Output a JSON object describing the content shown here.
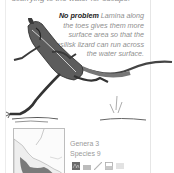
{
  "page": {
    "top_text_fragment": "scurrying to the water for escape.",
    "caption": {
      "heading": "No problem",
      "body": "Lamina along the toes gives them more surface area so that the basilisk lizard can run across the water surface."
    },
    "illustration": {
      "subject": "basilisk lizard running on water"
    },
    "range_map": {
      "region": "Central America",
      "highlight_color": "#7a7a7a"
    },
    "stats": {
      "genera_label": "Genera",
      "genera_value": "3",
      "species_label": "Species",
      "species_value": "9"
    },
    "habitat_icons": [
      {
        "name": "forest-icon"
      },
      {
        "name": "water-icon"
      },
      {
        "name": "branch-icon"
      },
      {
        "name": "river-icon"
      },
      {
        "name": "wetland-icon"
      }
    ]
  }
}
